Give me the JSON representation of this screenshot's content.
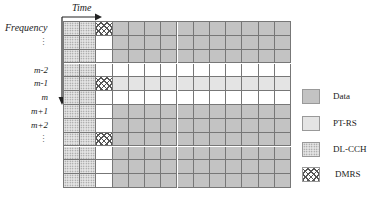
{
  "diagram": {
    "axes": {
      "time_label": "Time",
      "frequency_label": "Frequency"
    },
    "row_labels": [
      {
        "text": "⋮",
        "row": 1
      },
      {
        "text": "m-2",
        "row": 3
      },
      {
        "text": "m-1",
        "row": 4
      },
      {
        "text": "m",
        "row": 5
      },
      {
        "text": "m+1",
        "row": 6
      },
      {
        "text": "m+2",
        "row": 7
      },
      {
        "text": "⋮",
        "row": 8
      }
    ],
    "grid": {
      "rows": 12,
      "columns": 14,
      "layout": [
        [
          "dlcch",
          "dlcch",
          "dmrs",
          "data",
          "data",
          "data",
          "data",
          "data",
          "data",
          "data",
          "data",
          "data",
          "data",
          "data"
        ],
        [
          "dlcch",
          "dlcch",
          "empty",
          "data",
          "data",
          "data",
          "data",
          "data",
          "data",
          "data",
          "data",
          "data",
          "data",
          "data"
        ],
        [
          "dlcch",
          "dlcch",
          "empty",
          "data",
          "data",
          "data",
          "data",
          "data",
          "data",
          "data",
          "data",
          "data",
          "data",
          "data"
        ],
        [
          "dlcch",
          "dlcch",
          "empty",
          "empty",
          "empty",
          "empty",
          "empty",
          "empty",
          "empty",
          "empty",
          "empty",
          "empty",
          "empty",
          "empty"
        ],
        [
          "dlcch",
          "dlcch",
          "dmrs",
          "ptrs",
          "ptrs",
          "ptrs",
          "ptrs",
          "ptrs",
          "ptrs",
          "ptrs",
          "ptrs",
          "ptrs",
          "ptrs",
          "ptrs"
        ],
        [
          "dlcch",
          "dlcch",
          "empty",
          "empty",
          "empty",
          "empty",
          "empty",
          "empty",
          "empty",
          "empty",
          "empty",
          "empty",
          "empty",
          "empty"
        ],
        [
          "dlcch",
          "dlcch",
          "empty",
          "data",
          "data",
          "data",
          "data",
          "data",
          "data",
          "data",
          "data",
          "data",
          "data",
          "data"
        ],
        [
          "dlcch",
          "dlcch",
          "empty",
          "data",
          "data",
          "data",
          "data",
          "data",
          "data",
          "data",
          "data",
          "data",
          "data",
          "data"
        ],
        [
          "dlcch",
          "dlcch",
          "dmrs",
          "data",
          "data",
          "data",
          "data",
          "data",
          "data",
          "data",
          "data",
          "data",
          "data",
          "data"
        ],
        [
          "dlcch",
          "dlcch",
          "empty",
          "data",
          "data",
          "data",
          "data",
          "data",
          "data",
          "data",
          "data",
          "data",
          "data",
          "data"
        ],
        [
          "dlcch",
          "dlcch",
          "empty",
          "data",
          "data",
          "data",
          "data",
          "data",
          "data",
          "data",
          "data",
          "data",
          "data",
          "data"
        ],
        [
          "dlcch",
          "dlcch",
          "empty",
          "data",
          "data",
          "data",
          "data",
          "data",
          "data",
          "data",
          "data",
          "data",
          "data",
          "data"
        ]
      ]
    },
    "legend": [
      {
        "key": "data",
        "label": "Data"
      },
      {
        "key": "ptrs",
        "label": "PT-RS"
      },
      {
        "key": "dlcch",
        "label": "DL-CCH"
      },
      {
        "key": "dmrs",
        "label": "DMRS"
      }
    ],
    "colors": {
      "data": "#c3c3c3",
      "ptrs": "#e4e4e4",
      "dlcch": "#e6e6e6",
      "grid_line": "#777777"
    }
  }
}
